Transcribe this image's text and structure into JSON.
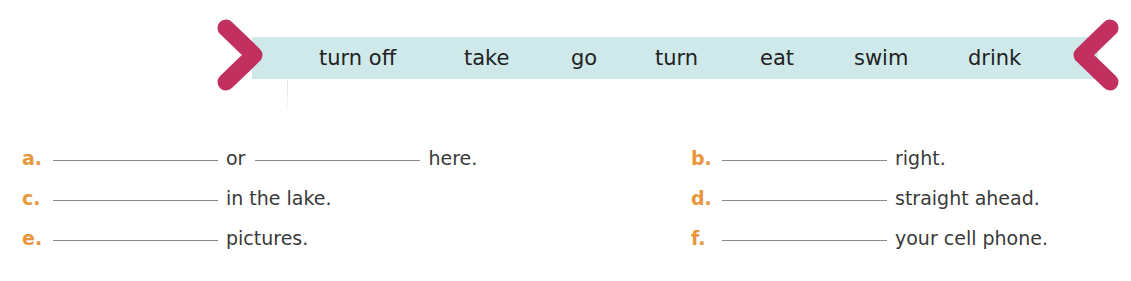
{
  "word_bank": {
    "words": [
      "turn off",
      "take",
      "go",
      "turn",
      "eat",
      "swim",
      "drink"
    ],
    "band_color": "#cfe9ea",
    "chevron_color": "#c2305f",
    "left_decoration_icon": "chevron-right-icon",
    "right_decoration_icon": "chevron-left-icon"
  },
  "exercise": {
    "label_color": "#e8963d",
    "items": [
      {
        "label": "a.",
        "parts": [
          "or",
          "here."
        ]
      },
      {
        "label": "b.",
        "parts": [
          "right."
        ]
      },
      {
        "label": "c.",
        "parts": [
          "in the lake."
        ]
      },
      {
        "label": "d.",
        "parts": [
          "straight ahead."
        ]
      },
      {
        "label": "e.",
        "parts": [
          "pictures."
        ]
      },
      {
        "label": "f.",
        "parts": [
          "your cell phone."
        ]
      }
    ]
  }
}
